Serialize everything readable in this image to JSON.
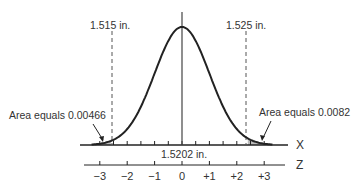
{
  "chart_data": {
    "type": "area",
    "title": "",
    "x_axis_label": "X",
    "z_axis_label": "Z",
    "mean_label": "1.5202 in.",
    "lower_limit": {
      "label": "1.515 in.",
      "z": -2.6,
      "tail_area_label": "Area equals 0.00466",
      "tail_area": 0.00466
    },
    "upper_limit": {
      "label": "1.525 in.",
      "z": 2.4,
      "tail_area_label": "Area equals 0.0082",
      "tail_area": 0.0082
    },
    "z_ticks": [
      "−3",
      "−2",
      "−1",
      "0",
      "+1",
      "+2",
      "+3"
    ],
    "z_values": [
      -3,
      -2,
      -1,
      0,
      1,
      2,
      3
    ],
    "mean": 1.5202,
    "colors": {
      "line": "#222222",
      "text": "#333333",
      "dash": "#555555"
    }
  }
}
